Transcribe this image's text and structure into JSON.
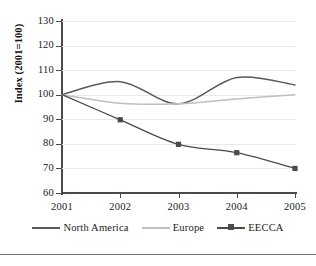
{
  "chart_data": {
    "type": "line",
    "title": "",
    "xlabel": "",
    "ylabel": "Index (2001=100)",
    "categories": [
      "2001",
      "2002",
      "2003",
      "2004",
      "2005"
    ],
    "x": [
      2001,
      2002,
      2003,
      2004,
      2005
    ],
    "xlim": [
      2001,
      2005
    ],
    "ylim": [
      60,
      130
    ],
    "yticks": [
      60,
      70,
      80,
      90,
      100,
      110,
      120,
      130
    ],
    "grid": true,
    "smoothed": true,
    "legend_position": "bottom",
    "series": [
      {
        "name": "North America",
        "values": [
          100,
          105.3,
          96.3,
          107,
          104
        ],
        "color": "#595959",
        "marker": "none"
      },
      {
        "name": "Europe",
        "values": [
          100,
          96.5,
          96.3,
          98.3,
          100
        ],
        "color": "#bfbfbf",
        "marker": "none"
      },
      {
        "name": "EECCA",
        "values": [
          100,
          89.8,
          79.8,
          76.4,
          70
        ],
        "color": "#4a4a4a",
        "marker": "square"
      }
    ]
  },
  "axes": {
    "y_tick_labels": [
      "130",
      "120",
      "110",
      "100",
      "90",
      "80",
      "70",
      "60"
    ],
    "x_tick_labels": [
      "2001",
      "2002",
      "2003",
      "2004",
      "2005"
    ],
    "y_axis_title": "Index (2001=100)"
  },
  "legend": {
    "items": [
      {
        "label": "North America",
        "color": "#595959",
        "marker": "none"
      },
      {
        "label": "Europe",
        "color": "#bfbfbf",
        "marker": "none"
      },
      {
        "label": "EECCA",
        "color": "#4a4a4a",
        "marker": "square"
      }
    ]
  },
  "colors": {
    "axis": "#4a4a4a",
    "grid": "#e9e9e9",
    "background": "#ffffff",
    "rule": "#77797c"
  }
}
